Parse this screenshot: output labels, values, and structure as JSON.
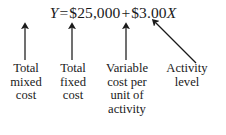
{
  "figure": {
    "background_color": "#ffffff",
    "ink_color": "#1a1a1a"
  },
  "equation": {
    "dependent_variable": "Y",
    "equals": "=",
    "fixed_cost_term": "$25,000",
    "plus": "+",
    "variable_rate": "$3.00",
    "independent_variable": "X",
    "full_text": "Y = $25,000 + $3.00X"
  },
  "labels": [
    {
      "id": "total-mixed-cost",
      "lines": [
        "Total",
        "mixed",
        "cost"
      ],
      "points_to": "Y",
      "arrow": "vertical"
    },
    {
      "id": "total-fixed-cost",
      "lines": [
        "Total",
        "fixed",
        "cost"
      ],
      "points_to": "$25,000",
      "arrow": "vertical"
    },
    {
      "id": "variable-cost-per-unit",
      "lines": [
        "Variable",
        "cost per",
        "unit of",
        "activity"
      ],
      "points_to": "$3.00",
      "arrow": "vertical"
    },
    {
      "id": "activity-level",
      "lines": [
        "Activity",
        "level"
      ],
      "points_to": "X",
      "arrow": "diagonal"
    }
  ]
}
